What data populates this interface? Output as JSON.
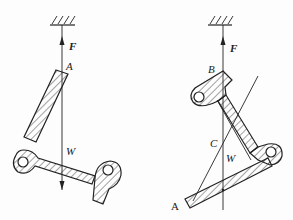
{
  "figure": {
    "left": {
      "labels": {
        "force": "F",
        "point_a": "A",
        "weight": "W"
      }
    },
    "right": {
      "labels": {
        "force": "F",
        "point_b": "B",
        "point_c": "C",
        "weight": "W",
        "point_a": "A"
      }
    }
  }
}
